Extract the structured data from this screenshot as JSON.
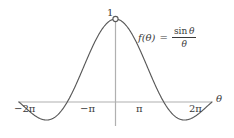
{
  "figure": {
    "background_color": "#ffffff",
    "curve_color": "#595959",
    "axis_color": "#b0b0b0",
    "text_color": "#3a3a3a"
  },
  "equation": {
    "lhs": "f(θ)",
    "equals": "=",
    "numerator_fn": "sin",
    "numerator_var": "θ",
    "denominator": "θ"
  },
  "labels": {
    "peak_value": "1",
    "axis_name_x": "θ"
  },
  "chart_data": {
    "type": "line",
    "title": "",
    "subtitle": "",
    "xlabel": "θ",
    "ylabel": "",
    "annotations": [
      {
        "text": "f(θ) = sin θ / θ",
        "kind": "equation",
        "x_px": 138,
        "y_px": 26
      },
      {
        "text": "1",
        "kind": "peak-value",
        "x": 0,
        "y": 1
      },
      {
        "kind": "open-circle",
        "note": "removable discontinuity at θ = 0",
        "x": 0,
        "y": 1,
        "filled": false
      }
    ],
    "grid": false,
    "legend": "none",
    "xlim": [
      -6.283185,
      6.283185
    ],
    "ylim": [
      -0.3,
      1.05
    ],
    "xticks": [
      -6.283185,
      -3.141593,
      3.141593,
      6.283185
    ],
    "xtick_labels": [
      "−2π",
      "−π",
      "π",
      "2π"
    ],
    "yticks": [],
    "ytick_labels": [],
    "series": [
      {
        "name": "sin(θ)/θ",
        "x": [
          -6.283185,
          -6.126106,
          -5.969026,
          -5.811947,
          -5.654867,
          -5.497787,
          -5.340708,
          -5.183628,
          -5.026548,
          -4.869469,
          -4.712389,
          -4.555309,
          -4.39823,
          -4.24115,
          -4.08407,
          -3.926991,
          -3.769911,
          -3.612832,
          -3.455752,
          -3.298672,
          -3.141593,
          -2.984513,
          -2.827433,
          -2.670354,
          -2.513274,
          -2.356194,
          -2.199115,
          -2.042035,
          -1.884956,
          -1.727876,
          -1.570796,
          -1.413717,
          -1.256637,
          -1.099557,
          -0.942478,
          -0.785398,
          -0.628319,
          -0.471239,
          -0.314159,
          -0.15708,
          0.0,
          0.15708,
          0.314159,
          0.471239,
          0.628319,
          0.785398,
          0.942478,
          1.099557,
          1.256637,
          1.413717,
          1.570796,
          1.727876,
          1.884956,
          2.042035,
          2.199115,
          2.356194,
          2.513274,
          2.670354,
          2.827433,
          2.984513,
          3.141593,
          3.298672,
          3.455752,
          3.612832,
          3.769911,
          3.926991,
          4.08407,
          4.24115,
          4.39823,
          4.555309,
          4.712389,
          4.869469,
          5.026548,
          5.183628,
          5.340708,
          5.497787,
          5.654867,
          5.811947,
          5.969026,
          6.126106,
          6.283185
        ],
        "y": [
          0.0,
          0.0255,
          0.0514,
          0.0768,
          0.1008,
          0.1225,
          0.1412,
          0.1563,
          0.1673,
          0.1738,
          0.1755,
          0.1725,
          0.1648,
          0.1527,
          0.1366,
          0.117,
          0.0946,
          0.0702,
          0.0447,
          0.0189,
          -0.0639,
          -0.0321,
          0.0,
          -0.0686,
          -0.1231,
          -0.1699,
          -0.2071,
          -0.2331,
          -0.247,
          -0.2482,
          -0.217,
          -0.2368,
          -0.2131,
          -0.1786,
          -0.1346,
          -0.0828,
          -0.0251,
          0.0364,
          0.1,
          0.1639,
          1.0,
          0.9589,
          0.9836,
          0.9362,
          0.9001,
          0.9003,
          0.8269,
          0.8069,
          0.7379,
          0.6906,
          0.6366,
          0.5652,
          0.4948,
          0.4229,
          0.3511,
          0.2806,
          0.2131,
          0.1497,
          0.0917,
          0.0398,
          0.0,
          -0.0251,
          -0.0455,
          -0.0612,
          -0.0723,
          -0.079,
          -0.0817,
          -0.0806,
          -0.0763,
          -0.0692,
          -0.06,
          -0.0491,
          -0.0373,
          -0.025,
          -0.0127,
          -0.0009,
          0.0101,
          0.0199,
          0.0283,
          0.035,
          0.0
        ],
        "y_exact_note": "y = sin(θ)/θ; zeros at ±π and ±2π; principal maximum 1 at θ=0 (shown as open circle); first minima ≈ -0.217 near θ = ±1.43π",
        "color": "#595959"
      }
    ]
  }
}
